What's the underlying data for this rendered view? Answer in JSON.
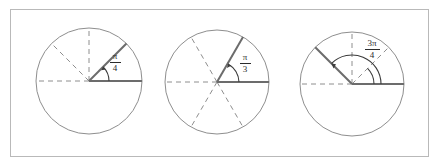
{
  "figure": {
    "width": 441,
    "height": 167,
    "background_color": "#ffffff",
    "frame": {
      "x": 10,
      "y": 9,
      "width": 419,
      "height": 148,
      "stroke_color": "#b9b9b9"
    },
    "colors": {
      "circle_outline": "#8e8e8e",
      "dashed_radius": "#8e8e8e",
      "solid_radius": "#6c6c6c",
      "arc_and_text": "#2b2b2b",
      "frame": "#b9b9b9"
    },
    "diagrams": [
      {
        "id": "unit-circle-pi-over-4",
        "center_x": 89,
        "center_y": 81,
        "radius": 53,
        "terminal_angle_degrees": 45,
        "label": {
          "numerator": "π",
          "denominator": "4",
          "text": "π/4",
          "x": 113,
          "y": 55
        },
        "arc": {
          "start_degrees": 0,
          "end_degrees": 45,
          "radius": 20,
          "arrowhead_at_degrees": 45
        },
        "solid_radii_degrees": [
          0,
          45
        ],
        "dashed_radii_degrees": [
          45,
          90,
          135,
          180
        ]
      },
      {
        "id": "unit-circle-pi-over-3",
        "center_x": 217,
        "center_y": 82,
        "radius": 52,
        "terminal_angle_degrees": 60,
        "label": {
          "numerator": "π",
          "denominator": "3",
          "text": "π/3",
          "x": 243,
          "y": 56
        },
        "arc": {
          "start_degrees": 0,
          "end_degrees": 60,
          "radius": 22,
          "arrowhead_at_degrees": 60
        },
        "solid_radii_degrees": [
          0,
          60
        ],
        "dashed_radii_degrees": [
          60,
          120,
          180,
          240,
          300
        ]
      },
      {
        "id": "unit-circle-3pi-over-4",
        "center_x": 352,
        "center_y": 84,
        "radius": 52,
        "terminal_angle_degrees": 135,
        "label": {
          "numerator": "3π",
          "denominator": "4",
          "text": "3π/4",
          "x": 371,
          "y": 42
        },
        "arc": {
          "start_degrees": 0,
          "end_degrees": 135,
          "radius": 29,
          "arrowhead_at_degrees": 135
        },
        "inner_arc": {
          "start_degrees": 0,
          "end_degrees": 45,
          "radius": 22
        },
        "solid_radii_degrees": [
          0,
          135
        ],
        "dashed_radii_degrees": [
          45,
          90,
          180
        ]
      }
    ]
  }
}
